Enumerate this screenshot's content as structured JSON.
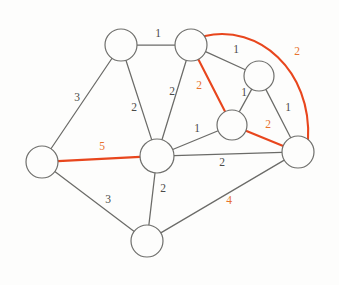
{
  "figure": {
    "background_color": "#fdfdfc",
    "edge_color": "#6b6b68",
    "highlight_color": "#e8461d",
    "highlight_label_color": "#e8722e",
    "node_fill": "#fdfdfc",
    "node_stroke": "#6f6f6c"
  },
  "nodes": [
    {
      "id": "n1",
      "label": "",
      "cx": 121,
      "cy": 45,
      "r": 16
    },
    {
      "id": "n2",
      "label": "",
      "cx": 191,
      "cy": 45,
      "r": 16
    },
    {
      "id": "n3",
      "label": "",
      "cx": 259,
      "cy": 76,
      "r": 15
    },
    {
      "id": "n4",
      "label": "",
      "cx": 232,
      "cy": 125,
      "r": 15
    },
    {
      "id": "n5",
      "label": "",
      "cx": 298,
      "cy": 152,
      "r": 16
    },
    {
      "id": "n6",
      "label": "",
      "cx": 157,
      "cy": 156,
      "r": 17
    },
    {
      "id": "n7",
      "label": "",
      "cx": 42,
      "cy": 162,
      "r": 16
    },
    {
      "id": "n8",
      "label": "",
      "cx": 147,
      "cy": 241,
      "r": 16
    }
  ],
  "edges": [
    {
      "id": "e-n1-n2",
      "from": "n1",
      "to": "n2",
      "weight": "1",
      "highlight": false,
      "label_x": 158,
      "label_y": 34,
      "shape": "line"
    },
    {
      "id": "e-n1-n7",
      "from": "n1",
      "to": "n7",
      "weight": "3",
      "highlight": false,
      "label_x": 77,
      "label_y": 98,
      "shape": "line"
    },
    {
      "id": "e-n1-n6",
      "from": "n1",
      "to": "n6",
      "weight": "2",
      "highlight": false,
      "label_x": 134,
      "label_y": 108,
      "shape": "line"
    },
    {
      "id": "e-n2-n6",
      "from": "n2",
      "to": "n6",
      "weight": "2",
      "highlight": false,
      "label_x": 172,
      "label_y": 92,
      "shape": "line"
    },
    {
      "id": "e-n2-n3",
      "from": "n2",
      "to": "n3",
      "weight": "1",
      "highlight": false,
      "label_x": 236,
      "label_y": 50,
      "shape": "line"
    },
    {
      "id": "e-n2-n4",
      "from": "n2",
      "to": "n4",
      "weight": "2",
      "highlight": true,
      "label_x": 199,
      "label_y": 86,
      "shape": "line"
    },
    {
      "id": "e-n2-n5",
      "from": "n2",
      "to": "n5",
      "weight": "2",
      "highlight": true,
      "label_x": 297,
      "label_y": 52,
      "shape": "arc"
    },
    {
      "id": "e-n3-n4",
      "from": "n3",
      "to": "n4",
      "weight": "1",
      "highlight": false,
      "label_x": 244,
      "label_y": 93,
      "shape": "line"
    },
    {
      "id": "e-n3-n5",
      "from": "n3",
      "to": "n5",
      "weight": "1",
      "highlight": false,
      "label_x": 288,
      "label_y": 108,
      "shape": "line"
    },
    {
      "id": "e-n4-n5",
      "from": "n4",
      "to": "n5",
      "weight": "2",
      "highlight": true,
      "label_x": 268,
      "label_y": 125,
      "shape": "line"
    },
    {
      "id": "e-n4-n6",
      "from": "n4",
      "to": "n6",
      "weight": "1",
      "highlight": false,
      "label_x": 197,
      "label_y": 129,
      "shape": "line"
    },
    {
      "id": "e-n5-n6",
      "from": "n5",
      "to": "n6",
      "weight": "2",
      "highlight": false,
      "label_x": 222,
      "label_y": 163,
      "shape": "line"
    },
    {
      "id": "e-n5-n8",
      "from": "n5",
      "to": "n8",
      "weight": "4",
      "highlight": false,
      "label_x": 229,
      "label_y": 201,
      "shape": "line",
      "label_highlight": true
    },
    {
      "id": "e-n6-n7",
      "from": "n6",
      "to": "n7",
      "weight": "5",
      "highlight": true,
      "label_x": 102,
      "label_y": 147,
      "shape": "line"
    },
    {
      "id": "e-n6-n8",
      "from": "n6",
      "to": "n8",
      "weight": "2",
      "highlight": false,
      "label_x": 163,
      "label_y": 189,
      "shape": "line"
    },
    {
      "id": "e-n7-n8",
      "from": "n7",
      "to": "n8",
      "weight": "3",
      "highlight": false,
      "label_x": 108,
      "label_y": 200,
      "shape": "line"
    }
  ],
  "arc_paths": {
    "e-n2-n5": "M 205,36 C 258,24 312,70 308,140"
  }
}
